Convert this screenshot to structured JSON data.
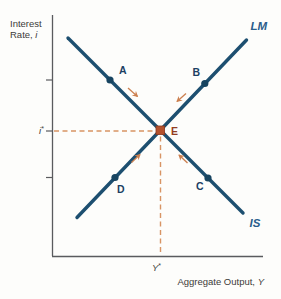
{
  "figure": {
    "y_axis_label_line1": "Interest",
    "y_axis_label_line2_prefix": "Rate, ",
    "y_axis_label_line2_var": "i",
    "x_axis_label_prefix": "Aggregate Output, ",
    "x_axis_label_var": "Y",
    "i_star_var": "i",
    "i_star_sup": "*",
    "y_star_var": "Y",
    "y_star_sup": "*",
    "curves": {
      "lm": {
        "label": "LM",
        "slope": "upward"
      },
      "is": {
        "label": "IS",
        "slope": "downward"
      }
    },
    "points": {
      "a": {
        "label": "A",
        "on_curve": "IS"
      },
      "b": {
        "label": "B",
        "on_curve": "LM"
      },
      "c": {
        "label": "C",
        "on_curve": "IS"
      },
      "d": {
        "label": "D",
        "on_curve": "LM"
      },
      "e": {
        "label": "E",
        "on_curve": "IS and LM intersection"
      }
    },
    "arrows_meaning": "four small orange arrows pointing toward equilibrium E",
    "colors": {
      "curve": "#1d4f70",
      "curve_label": "#2a5d8c",
      "point_marker": "#174460",
      "point_label": "#1c3f63",
      "equilibrium_marker": "#b4512c",
      "equilibrium_label": "#943d22",
      "dashed_guide": "#d89464",
      "arrow": "#cc8050",
      "axis": "#5a5b5e",
      "text": "#3c3b39",
      "background": "#fdfdfb"
    }
  }
}
